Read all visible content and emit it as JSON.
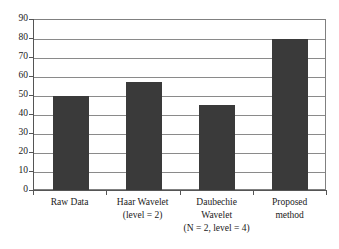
{
  "chart_data": {
    "type": "bar",
    "title": "",
    "subtitle": "",
    "xlabel": "",
    "ylabel": "",
    "categories": [
      "Raw Data",
      "Haar Wavelet (level = 2)",
      "Daubechie Wavelet (N = 2, level = 4)",
      "Proposed method"
    ],
    "category_lines": [
      [
        "Raw Data",
        "",
        ""
      ],
      [
        "Haar Wavelet",
        "(level = 2)",
        ""
      ],
      [
        "Daubechie",
        "Wavelet",
        "(N = 2, level = 4)"
      ],
      [
        "Proposed",
        "method",
        ""
      ]
    ],
    "values": [
      50,
      57.5,
      45.5,
      80
    ],
    "ylim": [
      0,
      90
    ],
    "yticks": [
      0,
      10,
      20,
      30,
      40,
      50,
      60,
      70,
      80,
      90
    ],
    "ytick_labels": [
      "0",
      "10",
      "20",
      "30",
      "40",
      "50",
      "60",
      "70",
      "80",
      "90"
    ],
    "grid": true,
    "grid_axis": "y",
    "legend": false,
    "legend_position": "none",
    "bar_color": "#3a3a3a",
    "grid_color": "#8a8a8a",
    "axis_color": "#555555",
    "background_color": "#ffffff",
    "text_color": "#1a1a1a"
  }
}
